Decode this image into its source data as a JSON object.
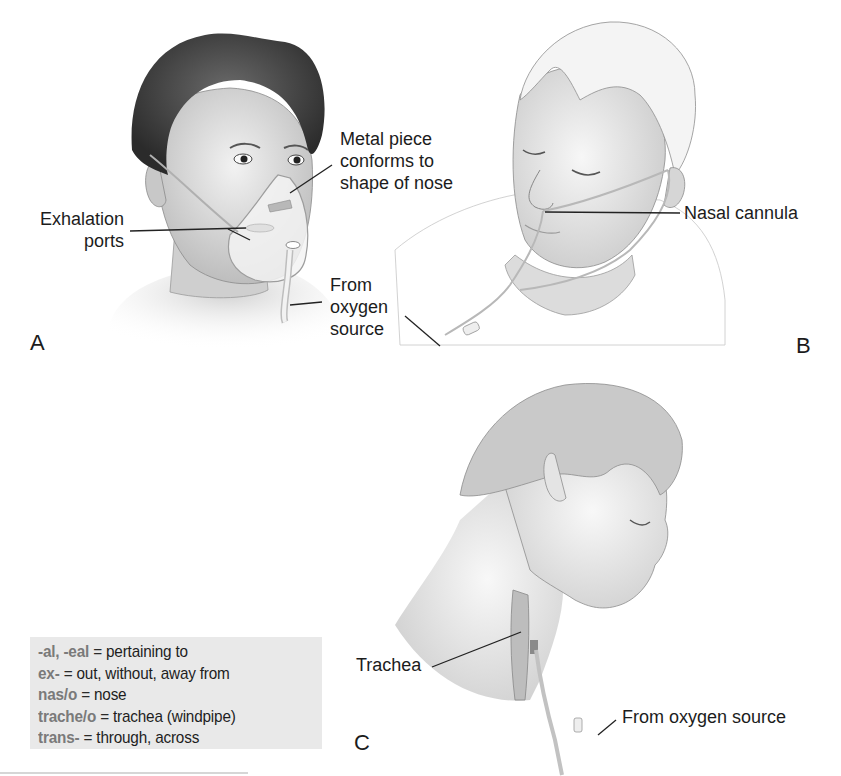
{
  "figure": {
    "panels": [
      {
        "id": "A",
        "letter": "A",
        "subject": "face mask",
        "labels": {
          "metal_piece": [
            "Metal piece",
            "conforms to",
            "shape of nose"
          ],
          "exhalation": [
            "Exhalation",
            "ports"
          ],
          "oxygen": [
            "From",
            "oxygen",
            "source"
          ]
        }
      },
      {
        "id": "B",
        "letter": "B",
        "subject": "nasal cannula",
        "labels": {
          "cannula": "Nasal cannula"
        }
      },
      {
        "id": "C",
        "letter": "C",
        "subject": "transtracheal oxygen",
        "labels": {
          "trachea": "Trachea",
          "oxygen": "From oxygen source"
        }
      }
    ]
  },
  "word_parts": {
    "items": [
      {
        "term": "-al, -eal",
        "eq": "=",
        "definition": "pertaining to"
      },
      {
        "term": "ex-",
        "eq": "=",
        "definition": "out, without, away from"
      },
      {
        "term": "nas/o",
        "eq": "=",
        "definition": "nose"
      },
      {
        "term": "trache/o",
        "eq": "=",
        "definition": "trachea (windpipe)"
      },
      {
        "term": "trans-",
        "eq": "=",
        "definition": "through, across"
      }
    ],
    "background": "#e9e9e9",
    "term_color": "#7a7a7a"
  }
}
